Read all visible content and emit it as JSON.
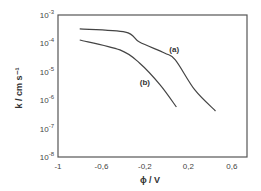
{
  "chart_data": {
    "type": "line",
    "title": "",
    "xlabel": "ϕ / V",
    "ylabel": "k / cm s⁻¹",
    "xlim": [
      -1,
      0.74
    ],
    "ylim_log10": [
      -8,
      -3
    ],
    "yscale": "log",
    "grid": false,
    "legend": "inline labels",
    "x_ticks": [
      -1,
      -0.6,
      -0.2,
      0.2,
      0.6
    ],
    "x_tick_labels": [
      "-1",
      "-0,6",
      "-0,2",
      "0,2",
      "0,6"
    ],
    "y_ticks_log10": [
      -3,
      -4,
      -5,
      -6,
      -7,
      -8
    ],
    "y_tick_labels": [
      {
        "base": "10",
        "exp": "-3"
      },
      {
        "base": "10",
        "exp": "-4"
      },
      {
        "base": "10",
        "exp": "-5"
      },
      {
        "base": "10",
        "exp": "-6"
      },
      {
        "base": "10",
        "exp": "-7"
      },
      {
        "base": "10",
        "exp": "-8"
      }
    ],
    "series": [
      {
        "name": "(a)",
        "x": [
          -0.8,
          -0.38,
          -0.25,
          -0.02,
          0.08,
          0.26,
          0.45
        ],
        "log10_y": [
          -3.49,
          -3.6,
          -3.95,
          -4.34,
          -4.58,
          -5.64,
          -6.38
        ],
        "label_pos": {
          "x": 0.07,
          "log10_y": -4.32
        }
      },
      {
        "name": "(b)",
        "x": [
          -0.8,
          -0.43,
          -0.25,
          -0.06,
          0.09
        ],
        "log10_y": [
          -3.88,
          -4.23,
          -4.69,
          -5.46,
          -6.24
        ],
        "label_pos": {
          "x": -0.2,
          "log10_y": -5.48
        }
      }
    ]
  }
}
